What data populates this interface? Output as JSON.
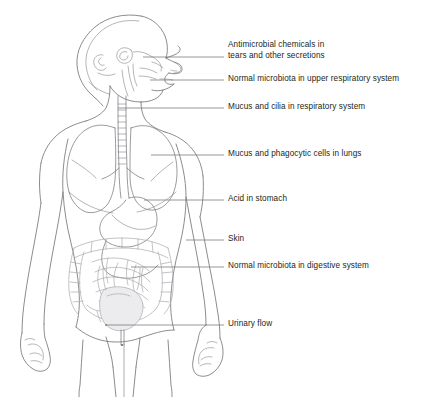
{
  "figure": {
    "background_color": "#ffffff",
    "line_color": "#6f6f73",
    "organ_line_color": "#7a7a7f",
    "gut_line_color": "#a9a9ae",
    "text_color": "#221f20",
    "view": "anterior body with head in right-facing profile, torso organs, arms and upper legs"
  },
  "labels": [
    {
      "id": "antimicrobial-chemicals",
      "text": "Antimicrobial chemicals in\ntears and other secretions",
      "text_x": 228,
      "text_y": 40,
      "leader_start_x": 143,
      "leader_start_y": 57,
      "leader_end_x": 224,
      "leader_end_y": 57,
      "anchor": "eye and nasal secretions"
    },
    {
      "id": "normal-microbiota-upper-respiratory",
      "text": "Normal microbiota in upper respiratory system",
      "text_x": 228,
      "text_y": 74,
      "leader_start_x": 150,
      "leader_start_y": 80,
      "leader_end_x": 224,
      "leader_end_y": 80,
      "anchor": "mouth and pharynx"
    },
    {
      "id": "mucus-cilia-respiratory",
      "text": "Mucus and cilia in respiratory system",
      "text_x": 228,
      "text_y": 102,
      "leader_start_x": 118,
      "leader_start_y": 108,
      "leader_end_x": 224,
      "leader_end_y": 108,
      "anchor": "trachea"
    },
    {
      "id": "mucus-phagocytic-lungs",
      "text": "Mucus and phagocytic cells in lungs",
      "text_x": 228,
      "text_y": 149,
      "leader_start_x": 151,
      "leader_start_y": 155,
      "leader_end_x": 224,
      "leader_end_y": 155,
      "anchor": "right lung"
    },
    {
      "id": "acid-in-stomach",
      "text": "Acid in stomach",
      "text_x": 228,
      "text_y": 194,
      "leader_start_x": 144,
      "leader_start_y": 200,
      "leader_end_x": 224,
      "leader_end_y": 200,
      "anchor": "stomach"
    },
    {
      "id": "skin",
      "text": "Skin",
      "text_x": 228,
      "text_y": 234,
      "leader_start_x": 186,
      "leader_start_y": 240,
      "leader_end_x": 224,
      "leader_end_y": 240,
      "anchor": "outer arm skin surface"
    },
    {
      "id": "normal-microbiota-digestive",
      "text": "Normal microbiota in digestive system",
      "text_x": 228,
      "text_y": 261,
      "leader_start_x": 131,
      "leader_start_y": 267,
      "leader_end_x": 224,
      "leader_end_y": 267,
      "anchor": "small intestine"
    },
    {
      "id": "urinary-flow",
      "text": "Urinary flow",
      "text_x": 228,
      "text_y": 319,
      "leader_start_x": 106,
      "leader_start_y": 325,
      "leader_end_x": 224,
      "leader_end_y": 325,
      "anchor": "urethra below bladder"
    }
  ]
}
